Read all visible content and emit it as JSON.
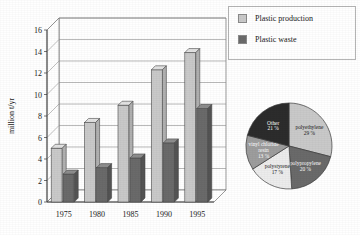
{
  "legend": {
    "items": [
      {
        "label": "Plastic production",
        "color": "#c9c9c9"
      },
      {
        "label": "Plastic waste",
        "color": "#6a6a6a"
      }
    ]
  },
  "chart_data": [
    {
      "type": "bar",
      "title": "",
      "xlabel": "",
      "ylabel": "million t/yr",
      "categories": [
        "1975",
        "1980",
        "1985",
        "1990",
        "1995"
      ],
      "ylim": [
        0,
        16
      ],
      "yticks": [
        "0",
        "2",
        "4",
        "6",
        "8",
        "10",
        "12",
        "14",
        "16"
      ],
      "grid": true,
      "legend_position": "right",
      "series": [
        {
          "name": "Plastic production",
          "color": "#c9c9c9",
          "values": [
            5.0,
            7.4,
            9.0,
            12.3,
            13.9
          ]
        },
        {
          "name": "Plastic waste",
          "color": "#6a6a6a",
          "values": [
            2.6,
            3.2,
            4.1,
            5.5,
            8.7
          ]
        }
      ]
    },
    {
      "type": "pie",
      "title": "",
      "labels": [
        "polyethylene",
        "polypropylene",
        "polystyrene",
        "vinyl chloride resin",
        "Other"
      ],
      "values": [
        29,
        20,
        17,
        13,
        21
      ],
      "value_suffix": " %",
      "colors": [
        "#c9c9c9",
        "#6a6a6a",
        "#ececec",
        "#9d9d9d",
        "#2c2c2c"
      ],
      "slices": [
        {
          "name": "polyethylene",
          "value": 29,
          "value_text": "29 %",
          "color": "#c9c9c9"
        },
        {
          "name": "polypropylene",
          "value": 20,
          "value_text": "20 %",
          "color": "#6a6a6a"
        },
        {
          "name": "polystyrene",
          "value": 17,
          "value_text": "17 %",
          "color": "#ececec"
        },
        {
          "name": "vinyl chloride resin",
          "value": 13,
          "value_text": "13 %",
          "color": "#9d9d9d"
        },
        {
          "name": "Other",
          "value": 21,
          "value_text": "21 %",
          "color": "#2c2c2c"
        }
      ]
    }
  ]
}
